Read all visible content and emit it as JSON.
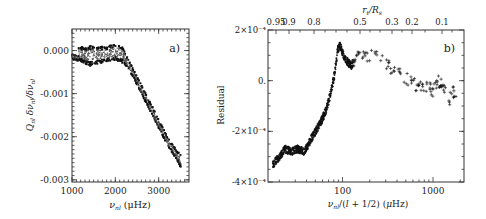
{
  "figure": {
    "panels": [
      {
        "id": "a",
        "label": "a)",
        "xlabel": "ν_nl (μHz)",
        "xlabel_main": "ν",
        "xlabel_sub": "nl",
        "xlabel_unit": "(μHz)",
        "ylabel": "Q_nl δν_nl/δν_nl",
        "yticks": [
          "0.000",
          "-0.001",
          "-0.002",
          "-0.003"
        ],
        "xticks": [
          "1000",
          "2000",
          "3000"
        ]
      },
      {
        "id": "b",
        "label": "b)",
        "xlabel": "ν_nl/(l + 1/2) (μHz)",
        "top_label": "r_t/R_s",
        "ylabel": "Residual",
        "yticks": [
          "2×10⁻⁴",
          "0.",
          "-2×10⁻⁴",
          "-4×10⁻⁴"
        ],
        "xticks": [
          "100",
          "1000"
        ],
        "top_ticks": [
          "0.95",
          "0.9",
          "0.8",
          "0.5",
          "0.3",
          "0.2",
          "0.1"
        ]
      }
    ]
  },
  "chart_data": [
    {
      "type": "scatter",
      "title": "a)",
      "xlabel": "ν_nl (μHz)",
      "ylabel": "Q_nl δν_nl/δν_nl",
      "xlim": [
        1000,
        3700
      ],
      "ylim": [
        -0.00305,
        0.0005
      ],
      "grid": false,
      "series": [
        {
          "name": "upper envelope",
          "x": [
            1150,
            1300,
            1450,
            1550,
            1650,
            1750,
            1850,
            1950,
            2050,
            2150,
            2250,
            2400,
            2600,
            2800,
            3000,
            3200,
            3400,
            3500
          ],
          "y": [
            0.0001,
            8e-05,
            0.00012,
            8e-05,
            0.00011,
            8e-05,
            0.00012,
            0.00015,
            0.00016,
            0.0001,
            -0.0001,
            -0.0004,
            -0.0008,
            -0.0012,
            -0.0016,
            -0.002,
            -0.0023,
            -0.0024
          ]
        },
        {
          "name": "lower envelope",
          "x": [
            1000,
            1200,
            1400,
            1600,
            1800,
            2000,
            2200,
            2400,
            2600,
            2800,
            3000,
            3200,
            3400,
            3500
          ],
          "y": [
            -0.0002,
            -0.00025,
            -0.00035,
            -0.0003,
            -0.00025,
            -0.00022,
            -0.0003,
            -0.0006,
            -0.001,
            -0.0014,
            -0.0018,
            -0.0022,
            -0.0025,
            -0.0027
          ]
        }
      ]
    },
    {
      "type": "scatter",
      "title": "b)",
      "xlabel": "ν_nl/(l + 1/2) (μHz)",
      "ylabel": "Residual",
      "x_scale": "log",
      "xlim": [
        15,
        2200
      ],
      "ylim": [
        -0.0004,
        0.0002
      ],
      "top_axis": {
        "label": "r_t/R_s",
        "ticks": [
          0.95,
          0.9,
          0.8,
          0.5,
          0.3,
          0.2,
          0.1
        ]
      },
      "grid": false,
      "series": [
        {
          "name": "residuals",
          "x": [
            17,
            20,
            23,
            27,
            32,
            38,
            45,
            52,
            60,
            68,
            75,
            82,
            88,
            93,
            100,
            110,
            125,
            140,
            170,
            200,
            250,
            300,
            380,
            450,
            550,
            650,
            800,
            1000,
            1100,
            1300,
            1500,
            1700
          ],
          "y": [
            -0.00033,
            -0.0003,
            -0.00027,
            -0.00028,
            -0.00027,
            -0.00028,
            -0.00023,
            -0.00019,
            -0.00015,
            -0.0001,
            -4e-05,
            3e-05,
            0.00012,
            0.00014,
            0.00011,
            8e-05,
            6e-05,
            9e-05,
            0.0001,
            0.0001,
            9e-05,
            7e-05,
            4e-05,
            2e-05,
            0.0,
            -2e-05,
            -2e-05,
            -4e-05,
            0.0,
            -2e-05,
            -8e-05,
            -4e-05
          ]
        }
      ]
    }
  ]
}
